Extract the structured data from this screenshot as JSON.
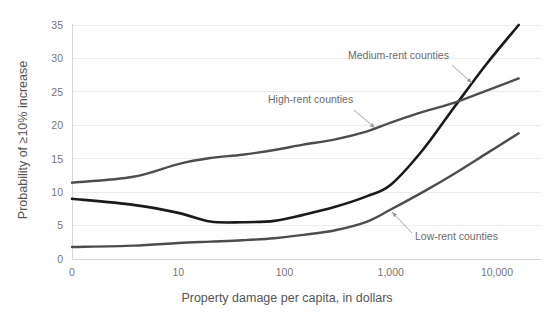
{
  "chart_data": {
    "type": "line",
    "title": "",
    "subtitle": "",
    "xlabel": "Property damage per capita, in dollars",
    "ylabel": "Probability of ≥10% increase",
    "xscale": "log",
    "x_tick_labels": [
      "0",
      "10",
      "100",
      "1,000",
      "10,000"
    ],
    "x_tick_values": [
      0,
      10,
      100,
      1000,
      10000
    ],
    "y_tick_labels": [
      "0",
      "5",
      "10",
      "15",
      "20",
      "25",
      "30",
      "35"
    ],
    "y_tick_values": [
      0,
      5,
      10,
      15,
      20,
      25,
      30,
      35
    ],
    "ylim": [
      0,
      36.5
    ],
    "grid": "horizontal",
    "legend": "inline-annotations",
    "x": [
      0,
      3,
      10,
      20,
      40,
      80,
      150,
      300,
      600,
      1000,
      2000,
      4000,
      8000,
      16000
    ],
    "series": [
      {
        "name": "Medium-rent counties",
        "color": "#1a1a1a",
        "width": 2.6,
        "values": [
          9.0,
          8.1,
          6.9,
          5.6,
          5.5,
          5.7,
          6.6,
          7.8,
          9.4,
          11.1,
          16.3,
          22.8,
          29.2,
          35.0
        ]
      },
      {
        "name": "High-rent counties",
        "color": "#4d4d4d",
        "width": 2.4,
        "values": [
          11.4,
          12.3,
          14.2,
          15.1,
          15.6,
          16.3,
          17.1,
          17.9,
          19.1,
          20.4,
          22.0,
          23.4,
          25.2,
          27.0
        ]
      },
      {
        "name": "Low-rent counties",
        "color": "#4d4d4d",
        "width": 2.4,
        "values": [
          1.8,
          2.0,
          2.4,
          2.6,
          2.8,
          3.1,
          3.6,
          4.3,
          5.6,
          7.4,
          10.0,
          12.8,
          15.8,
          18.8
        ]
      }
    ],
    "annotations": [
      {
        "text": "Medium-rent counties",
        "label_x": 348,
        "label_y": 59,
        "anchor": "start",
        "arrow_from_x": 452,
        "arrow_from_y": 65,
        "arrow_to_x": 472,
        "arrow_to_y": 83
      },
      {
        "text": "High-rent counties",
        "label_x": 268,
        "label_y": 103,
        "anchor": "start",
        "arrow_from_x": 354,
        "arrow_from_y": 110,
        "arrow_to_x": 375,
        "arrow_to_y": 128
      },
      {
        "text": "Low-rent counties",
        "label_x": 415,
        "label_y": 240,
        "anchor": "start",
        "arrow_from_x": 412,
        "arrow_from_y": 233,
        "arrow_to_x": 392,
        "arrow_to_y": 212
      }
    ]
  },
  "axes": {
    "x_title": "Property damage per capita, in dollars",
    "y_title": "Probability of ≥10% increase"
  }
}
